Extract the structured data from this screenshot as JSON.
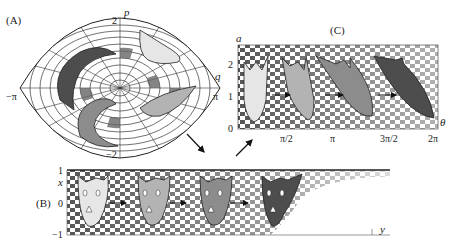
{
  "figure": {
    "panels": [
      {
        "id": "A",
        "label": "(A)",
        "axes": {
          "x_label": "q",
          "y_label": "p",
          "x_ticks": [
            "−π",
            "π"
          ],
          "y_ticks": [
            "2",
            "−2"
          ]
        },
        "description": "Lens-shaped phase-space region with radial checkerboard and four swirling shapes"
      },
      {
        "id": "B",
        "label": "(B)",
        "axes": {
          "x_label": "y",
          "y_label": "x",
          "y_ticks": [
            "1",
            "0",
            "−1"
          ]
        },
        "description": "Strip with distorted checkerboard and four successively darker face-shapes connected by arrows"
      },
      {
        "id": "C",
        "label": "(C)",
        "axes": {
          "x_label": "θ",
          "y_label": "a",
          "x_ticks": [
            "0",
            "π/2",
            "π",
            "3π/2",
            "2π"
          ],
          "y_ticks": [
            "0",
            "1",
            "2"
          ]
        },
        "description": "Rectangular checkerboard with four face-shapes progressively sheared, connected by arrows"
      }
    ],
    "shape_colors": [
      "#e6e6e6",
      "#b3b3b3",
      "#8c8c8c",
      "#4d4d4d"
    ],
    "checker_dark": "#555555",
    "checker_light": "#ffffff"
  }
}
